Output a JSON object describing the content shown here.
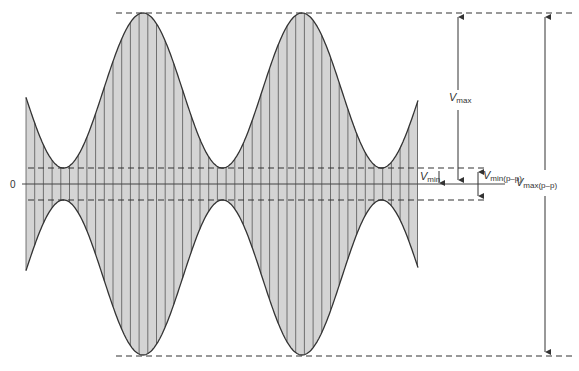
{
  "diagram": {
    "type": "amplitude-modulated-waveform",
    "colors": {
      "fill": "#d4d4d4",
      "stroke": "#333333",
      "carrier_lines": "#555555",
      "background": "#ffffff"
    },
    "zero_label": "0",
    "labels": {
      "vmax": {
        "main": "V",
        "sub": "max"
      },
      "vmin": {
        "main": "V",
        "sub": "min"
      },
      "vmin_pp": {
        "main": "V",
        "sub": "min(p–p)"
      },
      "vmax_pp": {
        "main": "V",
        "sub": "max(p–p)"
      }
    }
  }
}
